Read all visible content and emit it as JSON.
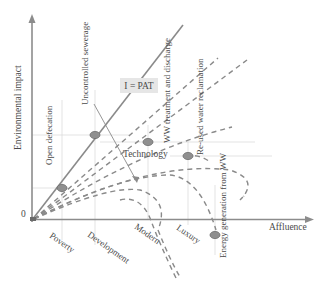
{
  "axes": {
    "y_label": "Environmental impact",
    "x_label": "Affluence",
    "origin_label": "0"
  },
  "equation_label": "I = PAT",
  "technology_label": "Technology",
  "stages": [
    {
      "label": "Poverty"
    },
    {
      "label": "Development"
    },
    {
      "label": "Modern"
    },
    {
      "label": "Luxury"
    }
  ],
  "points": [
    {
      "label": "Open defecation"
    },
    {
      "label": "Uncontrolled sewerage"
    },
    {
      "label": "WW treatment and discharge"
    },
    {
      "label": "Re-used water reclamation"
    },
    {
      "label": "Energy generation from WW"
    }
  ],
  "colors": {
    "axis": "#8c8c8c",
    "line": "#8a8a8a",
    "dot_fill": "#8f8f8f",
    "dot_stroke": "#6a6a6a",
    "guide": "#d9d9d9",
    "label_box": "#e6e6e6",
    "text": "#4a4a4a"
  }
}
